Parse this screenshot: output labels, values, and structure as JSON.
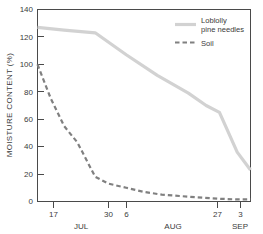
{
  "chart_data": {
    "type": "line",
    "title": "",
    "xlabel": "",
    "ylabel": "MOISTURE CONTENT (%)",
    "ylim": [
      0,
      140
    ],
    "yticks": [
      0,
      20,
      40,
      60,
      80,
      100,
      120,
      140
    ],
    "ytick_labels": [
      "0",
      "20",
      "40",
      "60",
      "80",
      "100",
      "120",
      "140"
    ],
    "grid": false,
    "legend_position": "top-right",
    "x_axis": {
      "ticks": [
        {
          "label": "17",
          "month": "JUL",
          "pos": 17
        },
        {
          "label": "30",
          "month": "JUL",
          "pos": 30
        },
        {
          "label": "6",
          "month": "AUG",
          "pos": 37
        },
        {
          "label": "27",
          "month": "AUG",
          "pos": 58
        },
        {
          "label": "3",
          "month": "SEP",
          "pos": 65
        }
      ],
      "month_labels": [
        "JUL",
        "AUG",
        "SEP"
      ]
    },
    "series": [
      {
        "name": "Loblolly pine needles",
        "legend_label_line1": "Loblolly",
        "legend_label_line2": "pine needles",
        "style": "solid",
        "color": "#d2d2d2",
        "x": [
          17,
          23,
          30,
          37,
          44,
          51,
          55,
          58,
          62,
          65
        ],
        "values": [
          127,
          125,
          123,
          107,
          92,
          79,
          70,
          65,
          36,
          23
        ]
      },
      {
        "name": "Soil",
        "legend_label_line1": "Soil",
        "legend_label_line2": "",
        "style": "dashed",
        "color": "#808080",
        "x": [
          17,
          20,
          23,
          26,
          30,
          33,
          37,
          41,
          45,
          49,
          53,
          58,
          62,
          65
        ],
        "values": [
          100,
          75,
          55,
          43,
          18,
          13,
          10,
          7,
          5,
          4,
          3,
          2,
          1.5,
          1.5
        ]
      }
    ]
  },
  "legend": {
    "entries": [
      {
        "label_line1": "Loblolly",
        "label_line2": "pine needles",
        "style": "solid"
      },
      {
        "label_line1": "Soil",
        "label_line2": "",
        "style": "dashed"
      }
    ]
  }
}
